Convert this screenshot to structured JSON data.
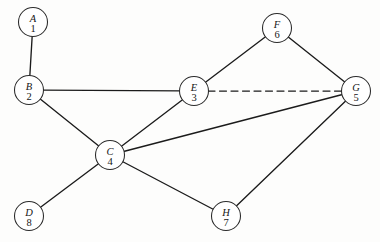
{
  "diagram": {
    "background_color": "#fdfdfc",
    "edge_color": "#1b1b1b",
    "node_fill_color": "#ffffff",
    "node_stroke_color": "#2a2a2a",
    "node_radius": 14.5,
    "nodes": [
      {
        "id": "A",
        "letter": "A",
        "number": "1",
        "x": 33,
        "y": 22
      },
      {
        "id": "B",
        "letter": "B",
        "number": "2",
        "x": 29,
        "y": 90
      },
      {
        "id": "C",
        "letter": "C",
        "number": "4",
        "x": 110,
        "y": 155
      },
      {
        "id": "D",
        "letter": "D",
        "number": "8",
        "x": 29,
        "y": 216
      },
      {
        "id": "E",
        "letter": "E",
        "number": "3",
        "x": 194,
        "y": 91
      },
      {
        "id": "F",
        "letter": "F",
        "number": "6",
        "x": 277,
        "y": 28
      },
      {
        "id": "G",
        "letter": "G",
        "number": "5",
        "x": 356,
        "y": 91
      },
      {
        "id": "H",
        "letter": "H",
        "number": "7",
        "x": 226,
        "y": 216
      }
    ],
    "edges": [
      {
        "from": "A",
        "to": "B",
        "style": "solid"
      },
      {
        "from": "B",
        "to": "E",
        "style": "solid"
      },
      {
        "from": "B",
        "to": "C",
        "style": "solid"
      },
      {
        "from": "C",
        "to": "E",
        "style": "solid"
      },
      {
        "from": "C",
        "to": "D",
        "style": "solid"
      },
      {
        "from": "C",
        "to": "G",
        "style": "solid"
      },
      {
        "from": "C",
        "to": "H",
        "style": "solid"
      },
      {
        "from": "E",
        "to": "F",
        "style": "solid"
      },
      {
        "from": "E",
        "to": "G",
        "style": "dashed"
      },
      {
        "from": "F",
        "to": "G",
        "style": "solid"
      },
      {
        "from": "G",
        "to": "H",
        "style": "solid"
      }
    ]
  }
}
